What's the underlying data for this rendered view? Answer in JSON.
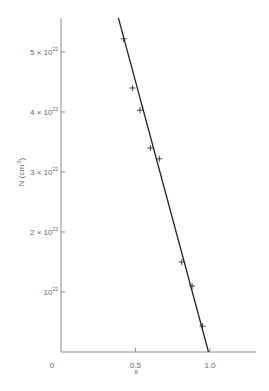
{
  "chart_data": {
    "type": "scatter",
    "title": "",
    "xlabel": "x",
    "ylabel": "N (cm",
    "ylabel_sup": "-3",
    "ylabel_close": ")",
    "xlim": [
      0,
      1.3
    ],
    "ylim": [
      0,
      5.6e+22
    ],
    "grid": false,
    "legend": null,
    "x_ticks": [
      {
        "value": 0,
        "label": "0"
      },
      {
        "value": 0.5,
        "label": "0.5"
      },
      {
        "value": 1.0,
        "label": "1.0"
      }
    ],
    "y_ticks": [
      {
        "value": 1e+22,
        "mant": "",
        "base": "10",
        "exp": "22"
      },
      {
        "value": 2e+22,
        "mant": "2 × ",
        "base": "10",
        "exp": "22"
      },
      {
        "value": 3e+22,
        "mant": "3 × ",
        "base": "10",
        "exp": "22"
      },
      {
        "value": 4e+22,
        "mant": "4 × ",
        "base": "10",
        "exp": "22"
      },
      {
        "value": 5e+22,
        "mant": "5 × ",
        "base": "10",
        "exp": "22"
      }
    ],
    "origin_label": "0",
    "series": [
      {
        "name": "measured",
        "marker": "+",
        "x": [
          0.42,
          0.48,
          0.53,
          0.6,
          0.66,
          0.81,
          0.88,
          0.95
        ],
        "y": [
          5.22e+22,
          4.4e+22,
          4.03e+22,
          3.4e+22,
          3.22e+22,
          1.5e+22,
          1.1e+22,
          4.3e+21
        ]
      },
      {
        "name": "linear fit",
        "type": "line",
        "x": [
          0.385,
          0.99
        ],
        "y": [
          5.57e+22,
          0.0
        ]
      }
    ]
  }
}
